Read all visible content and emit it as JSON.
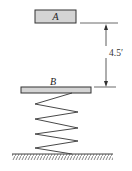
{
  "diagram": {
    "block_a": {
      "label": "A",
      "fill": "#d4d4d4",
      "stroke": "#333333"
    },
    "platform_b": {
      "label": "B",
      "fill": "#d4d4d4",
      "stroke": "#333333"
    },
    "dimension": {
      "value": "4.5′"
    },
    "spring": {
      "coils": 4,
      "stroke": "#333333"
    },
    "ground": {
      "stroke": "#444444"
    }
  }
}
